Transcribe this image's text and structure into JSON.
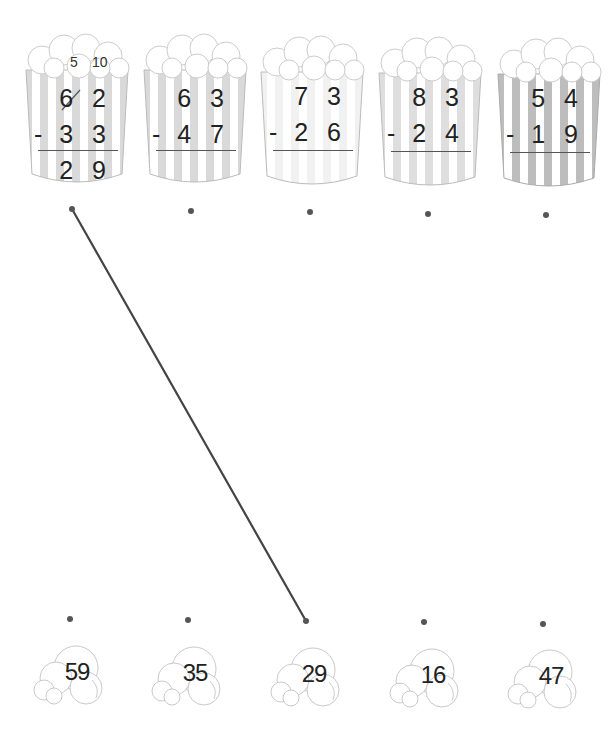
{
  "worksheet": {
    "problems": [
      {
        "top": "6 2",
        "bottom": "3 3",
        "answer": "2 9",
        "carry_tens": "5",
        "carry_ones": "10",
        "stripe": "#d9d9d9",
        "dot": [
          72,
          209
        ]
      },
      {
        "top": "6 3",
        "bottom": "4 7",
        "answer": "",
        "stripe": "#d9d9d9",
        "dot": [
          191,
          211
        ]
      },
      {
        "top": "7 3",
        "bottom": "2 6",
        "answer": "",
        "stripe": "#f1f1f1",
        "dot": [
          310,
          212
        ]
      },
      {
        "top": "8 3",
        "bottom": "2 4",
        "answer": "",
        "stripe": "#dedede",
        "dot": [
          428,
          214
        ]
      },
      {
        "top": "5 4",
        "bottom": "1 9",
        "answer": "",
        "stripe": "#bdbdbd",
        "dot": [
          546,
          215
        ]
      }
    ],
    "minus_sign": "-",
    "answers": [
      {
        "value": "59",
        "dot": [
          70,
          619
        ]
      },
      {
        "value": "35",
        "dot": [
          188,
          620
        ]
      },
      {
        "value": "29",
        "dot": [
          306,
          621
        ]
      },
      {
        "value": "16",
        "dot": [
          424,
          622
        ]
      },
      {
        "value": "47",
        "dot": [
          543,
          624
        ]
      }
    ],
    "drawn_lines": [
      {
        "from_problem": 0,
        "to_answer": 2,
        "color": "#444444"
      }
    ]
  }
}
